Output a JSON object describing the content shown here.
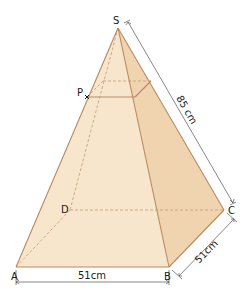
{
  "diagram": {
    "type": "square-based pyramid",
    "colors": {
      "face_front": "#f8e6cc",
      "face_right": "#f0d4b0",
      "face_left": "#fbecd8",
      "edge": "#b98a60",
      "hidden_edge": "#c9a27e",
      "dimension_line": "#555555"
    },
    "vertices": {
      "apex": "S",
      "base": [
        "A",
        "B",
        "C",
        "D"
      ],
      "point_on_edge": "P"
    },
    "dimensions": {
      "lateral_edge_SC": "85cm",
      "base_edge_AB": "51cm",
      "base_edge_BC": "51cm"
    },
    "labels": {
      "S": "S",
      "P": "P",
      "A": "A",
      "B": "B",
      "C": "C",
      "D": "D",
      "sc_length": "85 cm",
      "ab_length": "51cm",
      "bc_length": "51cm"
    }
  }
}
